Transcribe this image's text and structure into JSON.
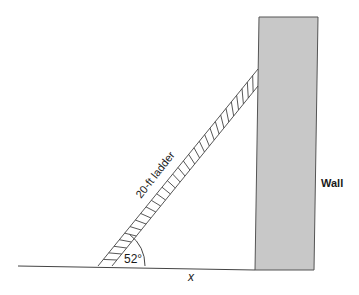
{
  "diagram": {
    "ladder_label": "20-ft ladder",
    "angle_label": "52°",
    "base_label": "x",
    "wall_label": "Wall",
    "ladder_length_ft": 20,
    "angle_deg": 52,
    "colors": {
      "wall_fill": "#c8c8c8",
      "wall_stroke": "#555555",
      "line": "#444444",
      "background": "#ffffff"
    }
  }
}
